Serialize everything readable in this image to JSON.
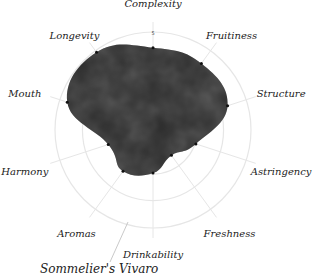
{
  "chart_data": {
    "type": "radar",
    "title": "",
    "axes": [
      "Complexity",
      "Fruitiness",
      "Structure",
      "Astringency",
      "Freshness",
      "Drinkability",
      "Aromas",
      "Harmony",
      "Mouth",
      "Longevity"
    ],
    "values": [
      4.2,
      4.2,
      4.0,
      2.3,
      1.6,
      2.2,
      2.6,
      2.4,
      4.6,
      4.9
    ],
    "rlim": [
      0,
      5
    ],
    "tick_labels": [
      "5"
    ],
    "grid": true,
    "fill_style": "dark watercolor texture",
    "colors": {
      "fill": "#2a2a2a",
      "grid": "#e6e6e6",
      "label": "#222222"
    }
  },
  "footer": {
    "cut_off_text": "Sommelier's Vivaro"
  }
}
